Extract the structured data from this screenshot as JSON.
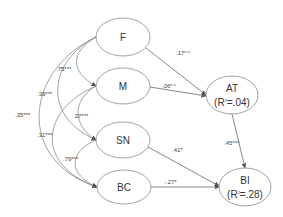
{
  "diagram": {
    "type": "path-model",
    "colors": {
      "stroke": "#8a8a8a",
      "node_fill": "#ffffff",
      "text": "#333333"
    },
    "nodes": [
      {
        "id": "F",
        "label": "F"
      },
      {
        "id": "M",
        "label": "M"
      },
      {
        "id": "SN",
        "label": "SN"
      },
      {
        "id": "BC",
        "label": "BC"
      },
      {
        "id": "AT",
        "label": "AT",
        "r2": "(R",
        "r2_sup": "2",
        "r2_val": "=.04)"
      },
      {
        "id": "BI",
        "label": "BI",
        "r2": "(R",
        "r2_sup": "2",
        "r2_val": "=.28)"
      }
    ],
    "paths": [
      {
        "from": "F",
        "to": "AT",
        "coef": ".17",
        "sig": "n.s."
      },
      {
        "from": "M",
        "to": "AT",
        "coef": ".06",
        "sig": "n.s."
      },
      {
        "from": "AT",
        "to": "BI",
        "coef": ".45",
        "sig": "***"
      },
      {
        "from": "SN",
        "to": "BI",
        "coef": ".41",
        "sig": "*"
      },
      {
        "from": "BC",
        "to": "BI",
        "coef": "-.27",
        "sig": "*"
      }
    ],
    "correlations": [
      {
        "a": "F",
        "b": "M",
        "coef": ".75",
        "sig": "***"
      },
      {
        "a": "F",
        "b": "SN",
        "coef": ".39",
        "sig": "***"
      },
      {
        "a": "F",
        "b": "BC",
        "coef": ".35",
        "sig": "***"
      },
      {
        "a": "M",
        "b": "SN",
        "coef": ".27",
        "sig": "***"
      },
      {
        "a": "M",
        "b": "BC",
        "coef": ".31",
        "sig": "***"
      },
      {
        "a": "SN",
        "b": "BC",
        "coef": ".79",
        "sig": "***"
      }
    ]
  }
}
